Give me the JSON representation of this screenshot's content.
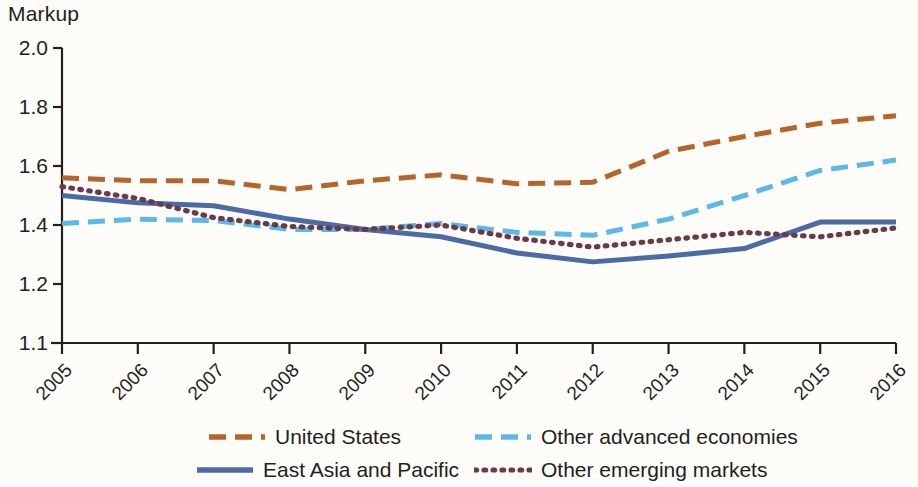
{
  "chart_data": {
    "type": "line",
    "title": "",
    "ylabel": "Markup",
    "xlabel": "",
    "ylim": [
      1.1,
      2.0
    ],
    "y_ticks": [
      "2.0",
      "1.8",
      "1.6",
      "1.4",
      "1.2",
      "1.1"
    ],
    "y_tick_values": [
      2.0,
      1.8,
      1.6,
      1.4,
      1.2,
      1.1
    ],
    "grid": false,
    "legend_position": "bottom",
    "x": [
      2005,
      2006,
      2007,
      2008,
      2009,
      2010,
      2011,
      2012,
      2013,
      2014,
      2015,
      2016
    ],
    "categories": [
      "2005",
      "2006",
      "2007",
      "2008",
      "2009",
      "2010",
      "2011",
      "2012",
      "2013",
      "2014",
      "2015",
      "2016"
    ],
    "series": [
      {
        "name": "United States",
        "color": "#B5652A",
        "style": "dashed",
        "values": [
          1.56,
          1.55,
          1.55,
          1.52,
          1.55,
          1.57,
          1.54,
          1.545,
          1.65,
          1.7,
          1.745,
          1.77
        ]
      },
      {
        "name": "Other advanced economies",
        "color": "#5BB8E8",
        "style": "dashed",
        "values": [
          1.405,
          1.42,
          1.415,
          1.385,
          1.385,
          1.405,
          1.375,
          1.365,
          1.42,
          1.5,
          1.585,
          1.62
        ]
      },
      {
        "name": "East Asia and Pacific",
        "color": "#4A6BA5",
        "style": "solid",
        "values": [
          1.5,
          1.475,
          1.465,
          1.42,
          1.385,
          1.36,
          1.305,
          1.275,
          1.295,
          1.32,
          1.41,
          1.41
        ]
      },
      {
        "name": "Other emerging markets",
        "color": "#6B3A4A",
        "style": "dotted",
        "values": [
          1.53,
          1.49,
          1.425,
          1.395,
          1.385,
          1.4,
          1.355,
          1.325,
          1.35,
          1.375,
          1.36,
          1.39
        ]
      }
    ]
  },
  "legend": {
    "items": [
      {
        "label": "United States",
        "key": "united-states"
      },
      {
        "label": "Other advanced economies",
        "key": "other-advanced-economies"
      },
      {
        "label": "East Asia and Pacific",
        "key": "east-asia-and-pacific"
      },
      {
        "label": "Other emerging markets",
        "key": "other-emerging-markets"
      }
    ]
  }
}
